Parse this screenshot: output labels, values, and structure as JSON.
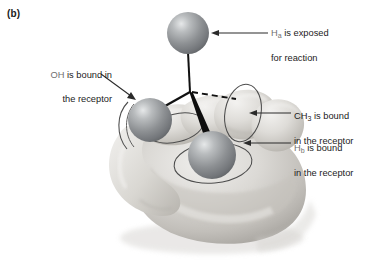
{
  "figure": {
    "panel_label": "(b)",
    "type": "illustration",
    "background_color": "#ffffff",
    "ink_color": "#1c1c1c",
    "sphere_color": "#8a8d90",
    "sphere_highlight": "#d8dadc",
    "hand_color": "#cfcdc9"
  },
  "callouts": {
    "ha": {
      "id": "ha-exposed",
      "prefix": "H",
      "subscript": "a",
      "line1_rest": " is exposed",
      "line2": "for reaction",
      "full_text": "Ha is exposed for reaction",
      "arrow": "points-left-to-top-sphere"
    },
    "oh": {
      "id": "oh-bound",
      "prefix": "OH",
      "subscript": "",
      "line1_rest": " is bound in",
      "line2": "the receptor",
      "full_text": "OH is bound in the receptor",
      "arrow": "points-down-right-to-left-sphere"
    },
    "ch3": {
      "id": "ch3-bound",
      "prefix": "CH",
      "subscript": "3",
      "line1_rest": " is bound",
      "line2": "in the receptor",
      "full_text": "CH3 is bound in the receptor",
      "arrow": "points-left-to-finger"
    },
    "hb": {
      "id": "hb-bound",
      "prefix": "H",
      "subscript": "b",
      "line1_rest": " is bound",
      "line2": "in the receptor",
      "full_text": "Hb is bound in the receptor",
      "arrow": "points-left-to-bottom-sphere"
    }
  },
  "molecule": {
    "center_label": "chiral-carbon",
    "center": {
      "x": 190,
      "y": 92
    },
    "substituents": [
      {
        "name": "Ha",
        "bond": "plain",
        "cx": 188,
        "cy": 33,
        "r": 21
      },
      {
        "name": "OH",
        "bond": "plain",
        "cx": 150,
        "cy": 120,
        "r": 22
      },
      {
        "name": "Hb",
        "bond": "wedge",
        "cx": 212,
        "cy": 155,
        "r": 24
      },
      {
        "name": "CH3",
        "bond": "dash",
        "cx": 231,
        "cy": 101,
        "r": 0
      }
    ]
  }
}
